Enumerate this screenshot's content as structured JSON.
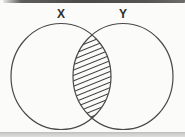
{
  "diagram": {
    "type": "venn",
    "left_label": "X",
    "right_label": "Y",
    "shaded_region": "intersection",
    "shading_style": "diagonal-hatch-lines",
    "colors": {
      "background": "#fbfbfa",
      "circle_stroke": "#4a4948",
      "hatch_stroke": "#3d3c3b",
      "label_text": "#2f2e2c",
      "top_edge_artifact": "#4b4a48",
      "bottom_edge_artifact": "#c9c9c7"
    }
  }
}
